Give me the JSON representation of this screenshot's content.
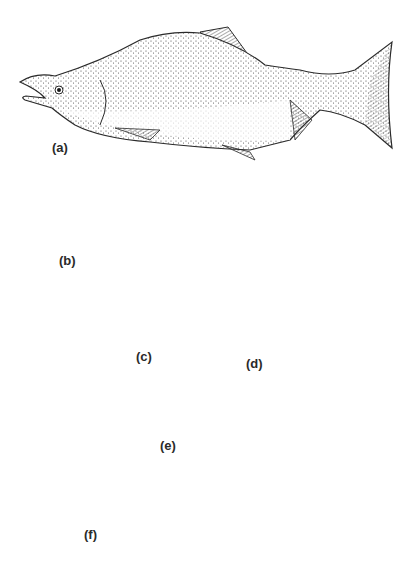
{
  "figure": {
    "panels": [
      {
        "id": "a",
        "label": "(a)",
        "description": "adult spawning male with hooked jaw and humped back"
      },
      {
        "id": "b",
        "label": "(b)",
        "description": "adult salmon"
      },
      {
        "id": "c",
        "label": "(c)",
        "description": "alevin with yolk sac"
      },
      {
        "id": "d",
        "label": "(d)",
        "description": "fry"
      },
      {
        "id": "e",
        "label": "(e)",
        "description": "fingerling"
      },
      {
        "id": "f",
        "label": "(f)",
        "description": "parr with dark parr marks"
      }
    ]
  },
  "colors": {
    "background": "#ffffff",
    "ink": "#2a2a2a",
    "stipple": "#3a3a3a"
  }
}
